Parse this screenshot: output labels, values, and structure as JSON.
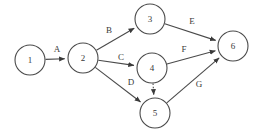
{
  "diagram": {
    "type": "directed-graph",
    "canvas": {
      "width": 260,
      "height": 134,
      "background": "#ffffff"
    },
    "style": {
      "node_stroke": "#4a4a4a",
      "node_fill": "#ffffff",
      "edge_stroke": "#4a4a4a",
      "text_color": "#3a3a3a",
      "node_radius": 15
    },
    "nodes": [
      {
        "id": "n1",
        "label": "1",
        "cx": 30,
        "cy": 60,
        "r": 15
      },
      {
        "id": "n2",
        "label": "2",
        "cx": 83,
        "cy": 58,
        "r": 15
      },
      {
        "id": "n3",
        "label": "3",
        "cx": 150,
        "cy": 19,
        "r": 15
      },
      {
        "id": "n4",
        "label": "4",
        "cx": 152,
        "cy": 68,
        "r": 15
      },
      {
        "id": "n5",
        "label": "5",
        "cx": 155,
        "cy": 113,
        "r": 15
      },
      {
        "id": "n6",
        "label": "6",
        "cx": 233,
        "cy": 46,
        "r": 15
      }
    ],
    "edges": [
      {
        "id": "eA",
        "label": "A",
        "from": "n1",
        "to": "n2",
        "style": "solid",
        "lx": 57,
        "ly": 50
      },
      {
        "id": "eB",
        "label": "B",
        "from": "n2",
        "to": "n3",
        "style": "solid",
        "lx": 109,
        "ly": 31
      },
      {
        "id": "eC",
        "label": "C",
        "from": "n2",
        "to": "n4",
        "style": "solid",
        "lx": 121,
        "ly": 58
      },
      {
        "id": "eD",
        "label": "D",
        "from": "n2",
        "to": "n5",
        "style": "solid",
        "lx": 131,
        "ly": 83
      },
      {
        "id": "eE",
        "label": "E",
        "from": "n3",
        "to": "n6",
        "style": "solid",
        "lx": 192,
        "ly": 22
      },
      {
        "id": "eF",
        "label": "F",
        "from": "n4",
        "to": "n6",
        "style": "solid",
        "lx": 184,
        "ly": 50
      },
      {
        "id": "eG",
        "label": "G",
        "from": "n5",
        "to": "n6",
        "style": "solid",
        "lx": 199,
        "ly": 85
      },
      {
        "id": "eDummy",
        "label": "",
        "from": "n4",
        "to": "n5",
        "style": "dashed",
        "lx": 0,
        "ly": 0
      }
    ]
  }
}
